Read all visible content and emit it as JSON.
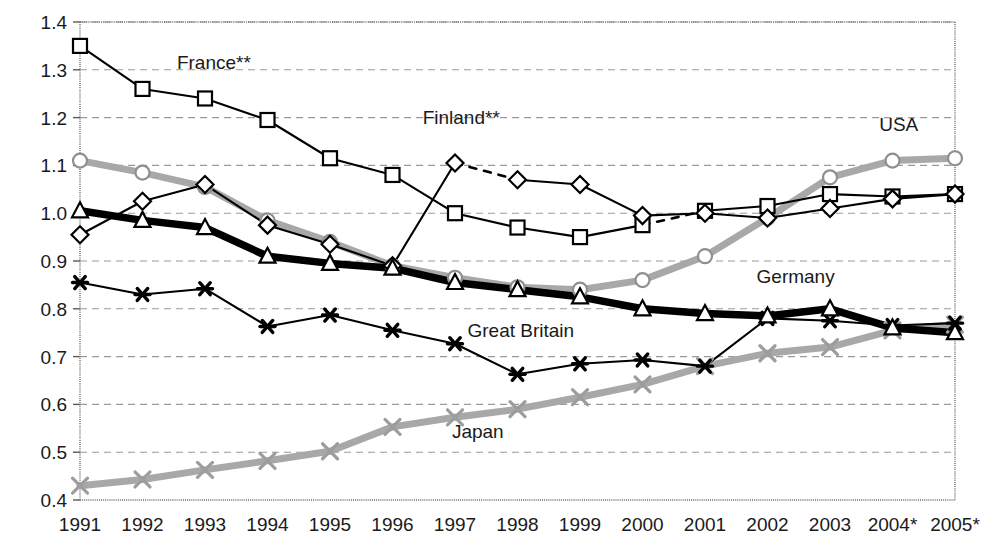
{
  "chart_data": {
    "type": "line",
    "title": "",
    "subtitle": "",
    "xlabel": "",
    "ylabel": "",
    "grid": true,
    "legend_position": "inline-annotations",
    "xlim": [
      1991,
      2005
    ],
    "ylim": [
      0.4,
      1.4
    ],
    "ytick_step": 0.1,
    "categories": [
      "1991",
      "1992",
      "1993",
      "1994",
      "1995",
      "1996",
      "1997",
      "1998",
      "1999",
      "2000",
      "2001",
      "2002",
      "2003",
      "2004*",
      "2005*"
    ],
    "ytick_labels": [
      "0.4",
      "0.5",
      "0.6",
      "0.7",
      "0.8",
      "0.9",
      "1.0",
      "1.1",
      "1.2",
      "1.3",
      "1.4"
    ],
    "series": [
      {
        "name": "France**",
        "marker": "open-square",
        "line_style": "thin-solid",
        "color": "#000000",
        "dashed_segments": [
          [
            2000,
            2001
          ]
        ],
        "values": [
          1.35,
          1.26,
          1.24,
          1.195,
          1.115,
          1.08,
          1.0,
          0.97,
          0.95,
          0.975,
          1.005,
          1.015,
          1.04,
          1.035,
          1.04
        ]
      },
      {
        "name": "Finland**",
        "marker": "open-diamond",
        "line_style": "thin-solid",
        "color": "#000000",
        "dashed_segments": [
          [
            1997,
            1998
          ]
        ],
        "values": [
          0.955,
          1.025,
          1.06,
          0.975,
          0.935,
          0.89,
          1.105,
          1.07,
          1.06,
          0.995,
          1.0,
          0.99,
          1.01,
          1.03,
          1.04
        ]
      },
      {
        "name": "USA",
        "marker": "open-circle",
        "line_style": "thick-gray",
        "color": "#a8a8a8",
        "dashed_segments": [],
        "values": [
          1.11,
          1.085,
          1.055,
          0.985,
          0.94,
          0.89,
          0.865,
          0.845,
          0.84,
          0.86,
          0.91,
          0.99,
          1.075,
          1.11,
          1.115
        ]
      },
      {
        "name": "Germany",
        "marker": "open-triangle",
        "line_style": "thick-black",
        "color": "#000000",
        "dashed_segments": [],
        "values": [
          1.005,
          0.985,
          0.97,
          0.91,
          0.895,
          0.885,
          0.855,
          0.84,
          0.825,
          0.8,
          0.79,
          0.785,
          0.8,
          0.76,
          0.75
        ]
      },
      {
        "name": "Great Britain",
        "marker": "filled-star",
        "line_style": "thin-solid",
        "color": "#000000",
        "dashed_segments": [],
        "values": [
          0.855,
          0.83,
          0.842,
          0.763,
          0.787,
          0.755,
          0.727,
          0.663,
          0.685,
          0.693,
          0.68,
          0.78,
          0.775,
          0.765,
          0.77
        ]
      },
      {
        "name": "Japan",
        "marker": "gray-cross",
        "line_style": "thick-gray",
        "color": "#9d9d9d",
        "dashed_segments": [],
        "values": [
          0.43,
          0.443,
          0.463,
          0.482,
          0.502,
          0.553,
          0.573,
          0.59,
          0.615,
          0.642,
          0.68,
          0.707,
          0.72,
          0.755,
          0.767
        ]
      }
    ],
    "annotations": [
      {
        "text": "France**",
        "x": 1992.55,
        "y": 1.302,
        "anchor": "start"
      },
      {
        "text": "Finland**",
        "x": 1997.1,
        "y": 1.186,
        "anchor": "middle"
      },
      {
        "text": "USA",
        "x": 2004.1,
        "y": 1.173,
        "anchor": "middle"
      },
      {
        "text": "Germany",
        "x": 2002.45,
        "y": 0.853,
        "anchor": "middle"
      },
      {
        "text": "Great Britain",
        "x": 1997.2,
        "y": 0.742,
        "anchor": "start"
      },
      {
        "text": "Japan",
        "x": 1996.95,
        "y": 0.53,
        "anchor": "start"
      }
    ]
  }
}
